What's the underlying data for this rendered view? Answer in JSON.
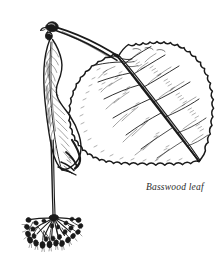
{
  "figure": {
    "caption": "Basswood leaf",
    "medium": "pen-and-ink line art",
    "ink_color": "#1a1a1a",
    "background_color": "#ffffff",
    "caption_color": "#2b2b2b",
    "parts": [
      {
        "name": "twig",
        "label": "twig"
      },
      {
        "name": "leaf",
        "label": "leaf"
      },
      {
        "name": "bract",
        "label": "bract"
      },
      {
        "name": "peduncle",
        "label": "peduncle"
      },
      {
        "name": "flower-cluster",
        "label": "flower cluster"
      }
    ]
  }
}
